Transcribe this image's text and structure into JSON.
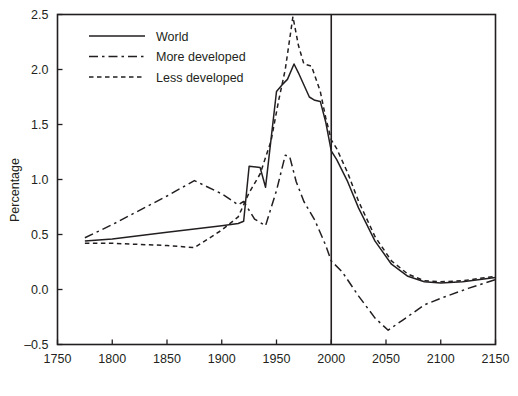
{
  "chart_data": {
    "type": "line",
    "title": "",
    "xlabel": "",
    "ylabel": "Percentage",
    "xlim": [
      1750,
      2150
    ],
    "ylim": [
      -0.5,
      2.5
    ],
    "xticks": [
      1750,
      1800,
      1850,
      1900,
      1950,
      2000,
      2050,
      2100,
      2150
    ],
    "yticks": [
      -0.5,
      0.0,
      0.5,
      1.0,
      1.5,
      2.0,
      2.5
    ],
    "xtick_labels": [
      "1750",
      "1800",
      "1850",
      "1900",
      "1950",
      "2000",
      "2050",
      "2100",
      "2150"
    ],
    "ytick_labels": [
      "–0.5",
      "0.0",
      "0.5",
      "1.0",
      "1.5",
      "2.0",
      "2.5"
    ],
    "grid": false,
    "legend_position": "top-left",
    "annotations": [
      {
        "name": "year-2000-divider",
        "type": "vline",
        "x": 2000
      }
    ],
    "series": [
      {
        "name": "World",
        "style": "solid",
        "x": [
          1775,
          1800,
          1850,
          1900,
          1915,
          1920,
          1925,
          1935,
          1940,
          1950,
          1955,
          1960,
          1966,
          1970,
          1980,
          1985,
          1990,
          1995,
          2000,
          2005,
          2015,
          2025,
          2040,
          2055,
          2070,
          2085,
          2100,
          2120,
          2150
        ],
        "values": [
          0.44,
          0.46,
          0.52,
          0.58,
          0.6,
          0.62,
          1.12,
          1.11,
          0.93,
          1.8,
          1.86,
          1.91,
          2.05,
          1.97,
          1.75,
          1.72,
          1.71,
          1.52,
          1.26,
          1.18,
          0.98,
          0.74,
          0.44,
          0.23,
          0.12,
          0.07,
          0.06,
          0.07,
          0.11
        ]
      },
      {
        "name": "More developed",
        "style": "dashdot",
        "x": [
          1775,
          1800,
          1850,
          1875,
          1900,
          1915,
          1920,
          1930,
          1940,
          1950,
          1958,
          1962,
          1968,
          1975,
          1985,
          1995,
          2000,
          2010,
          2025,
          2040,
          2052,
          2065,
          2085,
          2100,
          2125,
          2150
        ],
        "values": [
          0.47,
          0.59,
          0.85,
          0.99,
          0.87,
          0.77,
          0.8,
          0.64,
          0.58,
          0.9,
          1.22,
          1.21,
          0.98,
          0.8,
          0.63,
          0.4,
          0.26,
          0.16,
          -0.06,
          -0.26,
          -0.37,
          -0.28,
          -0.14,
          -0.08,
          0.01,
          0.09
        ]
      },
      {
        "name": "Less developed",
        "style": "dashed",
        "x": [
          1775,
          1800,
          1850,
          1875,
          1900,
          1910,
          1915,
          1925,
          1935,
          1945,
          1952,
          1958,
          1965,
          1970,
          1975,
          1982,
          1990,
          1995,
          2000,
          2005,
          2015,
          2025,
          2040,
          2055,
          2070,
          2085,
          2100,
          2120,
          2150
        ],
        "values": [
          0.42,
          0.42,
          0.4,
          0.38,
          0.54,
          0.62,
          0.66,
          0.88,
          1.05,
          1.35,
          1.72,
          2.0,
          2.48,
          2.22,
          2.05,
          2.03,
          1.8,
          1.56,
          1.36,
          1.28,
          1.06,
          0.8,
          0.48,
          0.26,
          0.14,
          0.08,
          0.07,
          0.08,
          0.12
        ]
      }
    ]
  },
  "legend": {
    "items": [
      {
        "label": "World",
        "style": "solid"
      },
      {
        "label": "More developed",
        "style": "dashdot"
      },
      {
        "label": "Less developed",
        "style": "dashed"
      }
    ]
  },
  "axes": {
    "y_title": "Percentage"
  }
}
